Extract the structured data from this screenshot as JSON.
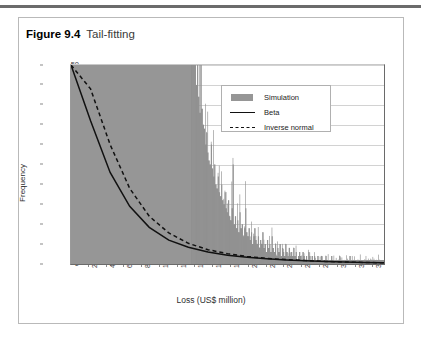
{
  "figure": {
    "number": "Figure 9.4",
    "title": "Tail-fitting"
  },
  "chart_data": {
    "type": "bar",
    "title": "Tail-fitting",
    "xlabel": "Loss (US$ million)",
    "ylabel": "Frequency",
    "ylim": [
      0,
      50
    ],
    "yticks": [
      0,
      5,
      10,
      15,
      20,
      25,
      30,
      35,
      40,
      45,
      50
    ],
    "grid": true,
    "legend_position": "upper-right",
    "xtick_labels": [
      "211",
      "422",
      "633",
      "843",
      "1,054",
      "1,256",
      "1,476",
      "1,687",
      "1,898",
      "2,108",
      "2,319",
      "2,530",
      "2,741",
      "2,952",
      "3,163",
      "3,373",
      "3,584"
    ],
    "categories": [
      "211",
      "422",
      "633",
      "843",
      "1,054",
      "1,256",
      "1,476",
      "1,687",
      "1,898",
      "2,108",
      "2,319",
      "2,530",
      "2,741",
      "2,952",
      "3,163",
      "3,373",
      "3,584"
    ],
    "values": [
      50,
      50,
      39,
      25,
      14,
      9,
      6,
      4,
      3,
      2,
      2,
      1,
      1,
      1,
      1,
      1,
      1
    ],
    "series": [
      {
        "name": "Simulation",
        "type": "bar",
        "color": "#969696",
        "values": [
          50,
          50,
          39,
          25,
          14,
          9,
          6,
          4,
          3,
          2,
          2,
          1,
          1,
          1,
          1,
          1,
          1
        ]
      },
      {
        "name": "Beta",
        "type": "line",
        "style": "solid",
        "color": "#111111",
        "values": [
          50,
          36,
          23,
          14.5,
          9.2,
          6.0,
          4.2,
          3.0,
          2.2,
          1.7,
          1.3,
          1.0,
          0.8,
          0.6,
          0.5,
          0.4,
          0.3
        ]
      },
      {
        "name": "Inverse normal",
        "type": "line",
        "style": "dashed",
        "color": "#111111",
        "values": [
          50,
          44,
          30,
          19,
          12,
          7.8,
          5.2,
          3.6,
          2.6,
          1.9,
          1.4,
          1.1,
          0.85,
          0.65,
          0.5,
          0.4,
          0.3
        ]
      }
    ],
    "histogram_detail": {
      "note": "dense simulated loss histogram, bin values left-to-right",
      "bins": [
        50,
        50,
        50,
        50,
        50,
        50,
        50,
        50,
        50,
        50,
        50,
        50,
        50,
        50,
        50,
        50,
        50,
        50,
        50,
        50,
        50,
        50,
        50,
        50,
        50,
        50,
        50,
        50,
        50,
        50,
        50,
        50,
        50,
        50,
        50,
        50,
        50,
        50,
        50,
        50,
        50,
        50,
        50,
        50,
        50,
        50,
        50,
        50,
        50,
        50,
        50,
        50,
        50,
        50,
        50,
        50,
        50,
        50,
        50,
        50,
        50,
        50,
        50,
        50,
        50,
        50,
        50,
        50,
        50,
        50,
        50,
        50,
        50,
        50,
        50,
        50,
        50,
        50,
        50,
        50,
        50,
        50,
        50,
        50,
        50,
        50,
        50,
        50,
        50,
        50,
        50,
        50,
        50,
        50,
        50,
        50,
        50,
        50,
        50,
        50,
        50,
        50,
        50,
        50,
        50,
        50,
        50,
        50,
        50,
        45,
        50,
        42,
        38,
        50,
        39,
        35,
        34,
        30,
        33,
        28,
        26,
        25,
        30,
        24,
        22,
        25,
        20,
        19,
        22,
        18,
        17,
        20,
        16,
        15,
        18,
        14,
        13,
        16,
        12,
        11,
        14,
        25,
        10,
        12,
        9,
        11,
        8,
        13,
        9,
        10,
        7,
        9,
        14,
        8,
        7,
        9,
        6,
        8,
        5,
        7,
        9,
        6,
        5,
        7,
        4,
        6,
        5,
        8,
        4,
        5,
        3,
        6,
        4,
        5,
        3,
        7,
        4,
        3,
        5,
        2,
        4,
        3,
        5,
        2,
        4,
        3,
        2,
        5,
        3,
        2,
        4,
        2,
        3,
        2,
        4,
        2,
        3,
        1,
        2,
        3,
        2,
        1,
        3,
        2,
        1,
        2,
        1,
        3,
        2,
        1,
        2,
        1,
        2,
        1,
        1,
        2,
        1,
        1,
        2,
        1,
        1,
        1,
        2,
        1,
        1,
        1,
        1,
        2,
        1,
        1,
        1,
        1,
        1,
        1,
        2,
        1,
        1,
        1,
        1,
        1,
        1,
        1,
        1,
        2,
        1,
        1,
        1,
        1,
        1,
        1,
        1,
        1,
        1,
        1,
        1,
        1,
        1,
        1,
        1,
        1,
        1,
        1,
        1,
        1,
        1,
        1,
        1,
        1,
        1,
        1,
        1,
        1,
        1
      ]
    }
  },
  "legend": {
    "items": [
      {
        "label": "Simulation",
        "key": "swatch"
      },
      {
        "label": "Beta",
        "key": "solid-line"
      },
      {
        "label": "Inverse normal",
        "key": "dashed-line"
      }
    ]
  }
}
